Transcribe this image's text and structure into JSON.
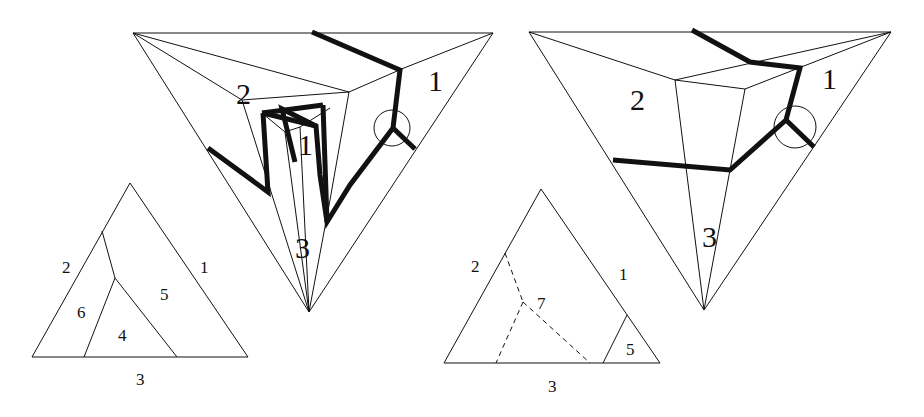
{
  "figures": {
    "left_big": {
      "labels": {
        "region_1": "1",
        "region_2": "2",
        "region_3": "3",
        "inner_1": "1"
      }
    },
    "right_big": {
      "labels": {
        "region_1": "1",
        "region_2": "2",
        "region_3": "3"
      }
    },
    "left_small": {
      "labels": {
        "edge_1": "1",
        "edge_2": "2",
        "edge_3": "3",
        "face_4": "4",
        "face_5": "5",
        "face_6": "6"
      }
    },
    "right_small": {
      "labels": {
        "edge_1": "1",
        "edge_2": "2",
        "edge_3": "3",
        "face_5": "5",
        "face_7": "7"
      }
    }
  }
}
